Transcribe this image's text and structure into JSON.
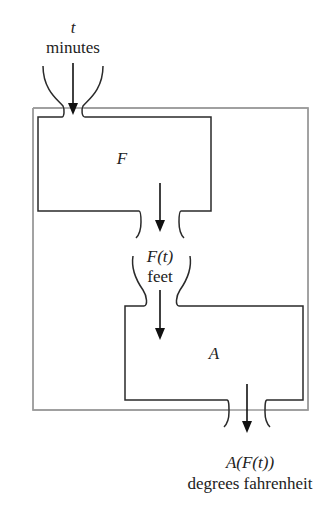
{
  "diagram": {
    "input": {
      "variable": "t",
      "unit": "minutes"
    },
    "box_f": {
      "label": "F"
    },
    "intermediate": {
      "expression": "F(t)",
      "unit": "feet"
    },
    "box_a": {
      "label": "A"
    },
    "output": {
      "expression": "A(F(t))",
      "unit": "degrees fahrenheit"
    },
    "colors": {
      "inner_box": "#2a2a2a",
      "outer_box": "#9a9a9a",
      "arrow": "#111111"
    }
  }
}
